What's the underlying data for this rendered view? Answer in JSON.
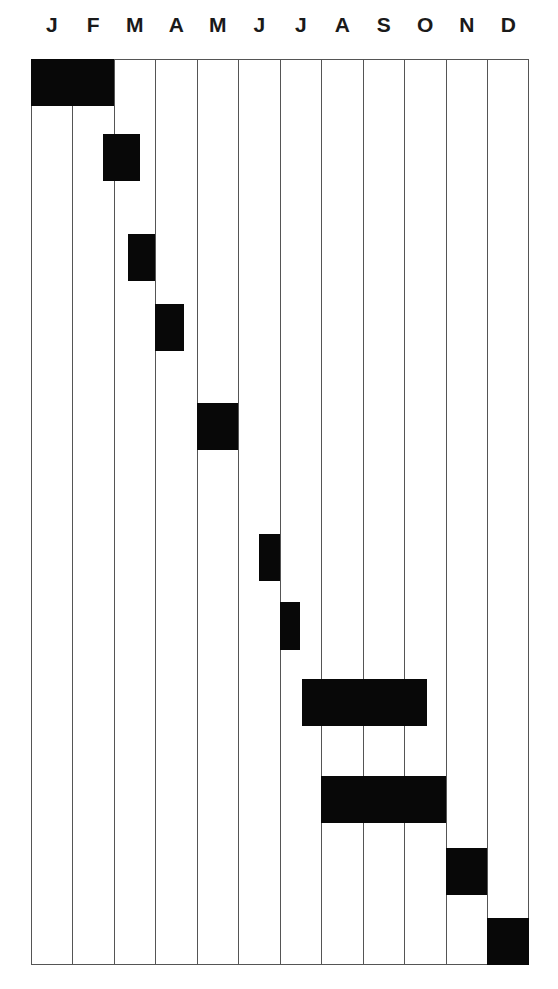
{
  "chart_data": {
    "type": "gantt",
    "title": "",
    "xlabel": "",
    "ylabel": "",
    "categories": [
      "J",
      "F",
      "M",
      "A",
      "M",
      "J",
      "J",
      "A",
      "S",
      "O",
      "N",
      "D"
    ],
    "x_range": [
      0,
      12
    ],
    "grid": "vertical lines at month boundaries",
    "legend": "none",
    "bar_color": "#080808",
    "tasks": [
      {
        "row": 1,
        "start": 0.0,
        "end": 2.0,
        "label": ""
      },
      {
        "row": 2,
        "start": 1.75,
        "end": 2.65,
        "label": ""
      },
      {
        "row": 3,
        "start": 2.35,
        "end": 3.0,
        "label": ""
      },
      {
        "row": 4,
        "start": 3.0,
        "end": 3.7,
        "label": ""
      },
      {
        "row": 5,
        "start": 4.0,
        "end": 5.0,
        "label": ""
      },
      {
        "row": 6,
        "start": 5.5,
        "end": 6.0,
        "label": ""
      },
      {
        "row": 7,
        "start": 6.0,
        "end": 6.5,
        "label": ""
      },
      {
        "row": 8,
        "start": 6.55,
        "end": 9.55,
        "label": ""
      },
      {
        "row": 9,
        "start": 7.0,
        "end": 10.0,
        "label": ""
      },
      {
        "row": 10,
        "start": 10.0,
        "end": 11.0,
        "label": ""
      },
      {
        "row": 11,
        "start": 11.0,
        "end": 12.0,
        "label": ""
      }
    ],
    "bar_y_px": [
      [
        0,
        47
      ],
      [
        75,
        122
      ],
      [
        175,
        222
      ],
      [
        245,
        292
      ],
      [
        344,
        391
      ],
      [
        475,
        522
      ],
      [
        543,
        591
      ],
      [
        620,
        667
      ],
      [
        717,
        764
      ],
      [
        789,
        836
      ],
      [
        859,
        906
      ]
    ]
  }
}
